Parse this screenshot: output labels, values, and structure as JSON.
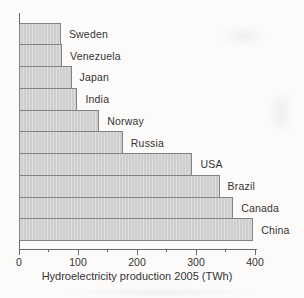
{
  "figure": {
    "background": "#fcfbfa"
  },
  "chart_data": {
    "type": "bar",
    "orientation": "horizontal",
    "title": "",
    "xlabel": "Hydroelectricity production 2005 (TWh)",
    "ylabel": "",
    "categories": [
      "Sweden",
      "Venezuela",
      "Japan",
      "India",
      "Norway",
      "Russia",
      "USA",
      "Brazil",
      "Canada",
      "China"
    ],
    "values": [
      71,
      73,
      89,
      99,
      136,
      176,
      294,
      340,
      363,
      397
    ],
    "xlim": [
      0,
      400
    ],
    "x_major_ticks": [
      0,
      100,
      200,
      300,
      400
    ],
    "x_major_tick_labels": [
      "0",
      "100",
      "200",
      "300",
      "400"
    ],
    "x_minor_ticks": [
      50,
      150,
      250,
      350
    ],
    "grid": false,
    "legend": false,
    "sort_order": "ascending-top-to-bottom",
    "bar_fill": "#d3d3d3",
    "bar_border": "#828282",
    "axis_color": "#6a6a6a",
    "text_color": "#333333"
  }
}
